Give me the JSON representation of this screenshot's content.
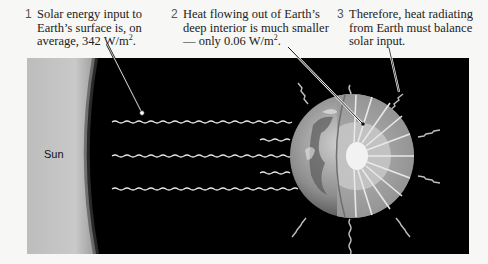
{
  "captions": [
    {
      "number": "1",
      "lines": [
        "Solar energy input to",
        "Earth’s surface is, on",
        "average, 342 W/m"
      ],
      "superscript": "2",
      "suffix": "."
    },
    {
      "number": "2",
      "lines": [
        "Heat flowing out of Earth’s",
        "deep interior is much smaller",
        "— only 0.06 W/m"
      ],
      "superscript": "2",
      "suffix": "."
    },
    {
      "number": "3",
      "lines": [
        "Therefore, heat radiating",
        "from Earth must balance",
        "solar input."
      ]
    }
  ],
  "labels": {
    "sun": "Sun"
  },
  "colors": {
    "space": "#000000",
    "sun": "#c8c8c8",
    "earth_surface": "#8a8a8a",
    "mantle": "#a0a0a0",
    "outer_core": "#c0c0c0",
    "inner_core": "#f0f0f0",
    "rays": "#e0e0e0"
  }
}
